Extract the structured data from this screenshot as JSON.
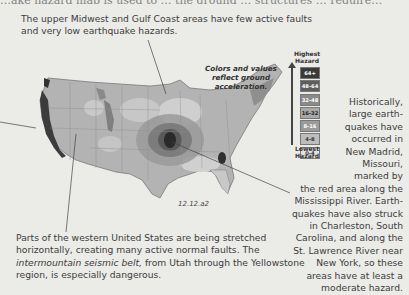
{
  "header": {
    "cutoff_text": "…ake hazard map is used to … the ground … structures … require…"
  },
  "captions": {
    "top": "The upper Midwest and Gulf Coast areas have few active faults and very low earthquake hazards.",
    "bottom_part1": "Parts of the western United States are being stretched horizontally, creating many active normal faults. The ",
    "bottom_italic": "intermountain seismic belt,",
    "bottom_part2": " from Utah through the Yellowstone region, is especially dangerous.",
    "right_lines": [
      "Historically,",
      "large earth-",
      "quakes have",
      "occurred in",
      "New Madrid,",
      "Missouri,",
      "marked by",
      "the red area along the",
      "Mississippi River. Earth-",
      "quakes have also struck",
      "in Charleston, South",
      "Carolina, and along the",
      "St. Lawrence River near",
      "New York, so these",
      "areas have at least a",
      "moderate hazard."
    ]
  },
  "map": {
    "note": "Colors and values reflect ground acceleration.",
    "figure_id": "12.12.a2"
  },
  "legend": {
    "top_label_1": "Highest",
    "top_label_2": "Hazard",
    "bottom_label_1": "Lowest",
    "bottom_label_2": "Hazard",
    "items": [
      {
        "label": "64+",
        "color": "#3a3a3a",
        "text_color": "#ffffff"
      },
      {
        "label": "48-64",
        "color": "#5e5e5e",
        "text_color": "#ffffff"
      },
      {
        "label": "32-48",
        "color": "#8a8a8a",
        "text_color": "#ffffff"
      },
      {
        "label": "16-32",
        "color": "#a8a8a8",
        "text_color": "#222222"
      },
      {
        "label": "8-16",
        "color": "#9b9b9b",
        "text_color": "#ffffff"
      },
      {
        "label": "4-8",
        "color": "#bdbdbd",
        "text_color": "#333333"
      },
      {
        "label": "0-4",
        "color": "#e2e2e2",
        "text_color": "#333333"
      }
    ]
  }
}
